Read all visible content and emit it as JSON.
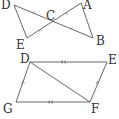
{
  "figure_top": {
    "labels": {
      "D": "D",
      "A": "A",
      "C": "C",
      "E": "E",
      "B": "B"
    },
    "segments": [
      "DB",
      "AE",
      "DE",
      "AB"
    ],
    "markings": "DC and CB marked with single ticks; AC and CE marked with single ticks"
  },
  "figure_bottom": {
    "labels": {
      "D": "D",
      "E": "E",
      "G": "G",
      "F": "F"
    },
    "segments": [
      "DE",
      "GF",
      "DG",
      "EF",
      "DF"
    ],
    "markings": "DE and GF marked with double arrows (parallel); DG and EF marked with single arrows (parallel)"
  },
  "colors": {
    "line": "#555555",
    "label": "#333333",
    "background": "#ffffff"
  }
}
